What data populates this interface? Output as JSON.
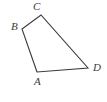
{
  "figure": {
    "kind": "geometry-diagram",
    "shape_name": "quadrilateral ABCD",
    "canvas": {
      "width": 107,
      "height": 102
    },
    "background_color": "#ffffff",
    "stroke_color": "#3b3b3b",
    "stroke_width": 1.1,
    "label_color": "#3b3b3b",
    "label_font_size": 11,
    "label_style": "italic-serif"
  },
  "chart_data": {
    "type": "scatter",
    "title": "",
    "xlabel": "",
    "ylabel": "",
    "xlim": [
      0,
      107
    ],
    "ylim": [
      0,
      102
    ],
    "grid": false,
    "legend": "none",
    "points": [
      {
        "name": "A",
        "x": 37,
        "y": 72
      },
      {
        "name": "B",
        "x": 22,
        "y": 29
      },
      {
        "name": "C",
        "x": 41,
        "y": 15
      },
      {
        "name": "D",
        "x": 88,
        "y": 68
      }
    ],
    "polygon_path": "37,72 22,29 41,15 88,68",
    "edges": [
      {
        "name": "edge-BC",
        "from": "B",
        "to": "C"
      },
      {
        "name": "edge-CD",
        "from": "C",
        "to": "D"
      },
      {
        "name": "edge-DA",
        "from": "D",
        "to": "A"
      },
      {
        "name": "edge-AB",
        "from": "A",
        "to": "B"
      }
    ]
  },
  "labels": {
    "a": {
      "text": "A",
      "x": 34,
      "y": 76
    },
    "b": {
      "text": "B",
      "x": 11,
      "y": 21
    },
    "c": {
      "text": "C",
      "x": 33,
      "y": 1
    },
    "d": {
      "text": "D",
      "x": 93,
      "y": 62
    }
  }
}
